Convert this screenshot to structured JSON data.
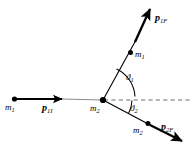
{
  "figure": {
    "background_color": "#ffffff",
    "stroke_color": "#000000",
    "width": 193,
    "height": 148
  },
  "labels": {
    "mass_incoming": {
      "symbol": "m",
      "subscript": "1",
      "text": "m1"
    },
    "momentum_initial": {
      "symbol": "p",
      "subscript": "1I",
      "text": "p1I"
    },
    "mass_target": {
      "symbol": "m",
      "subscript": "2",
      "text": "m2"
    },
    "mass_scattered_1": {
      "symbol": "m",
      "subscript": "1",
      "text": "m1"
    },
    "momentum_final_1": {
      "symbol": "p",
      "subscript": "1F",
      "text": "p1F"
    },
    "mass_scattered_2": {
      "symbol": "m",
      "subscript": "2",
      "text": "m2"
    },
    "momentum_final_2": {
      "symbol": "p",
      "subscript": "2F",
      "text": "p2F"
    },
    "angle_upper": {
      "symbol": "ϑ",
      "subscript": "1",
      "text": "ϑ1"
    },
    "angle_lower": {
      "symbol": "ϑ",
      "subscript": "2",
      "text": "ϑ2"
    }
  },
  "geometry": {
    "vertex": {
      "x": 103,
      "y": 100
    },
    "incoming_dot": {
      "x": 14,
      "y": 99
    },
    "incoming_arrow_tip": {
      "x": 63,
      "y": 99
    },
    "upper_branch_tip": {
      "x": 152,
      "y": 4
    },
    "upper_branch_dot": {
      "x": 130,
      "y": 53
    },
    "lower_branch_tip": {
      "x": 186,
      "y": 143
    },
    "lower_branch_dot": {
      "x": 148,
      "y": 124
    },
    "dashed_axis_end": {
      "x": 191,
      "y": 100
    },
    "angle_upper_degrees": 77,
    "angle_lower_degrees": 28
  }
}
